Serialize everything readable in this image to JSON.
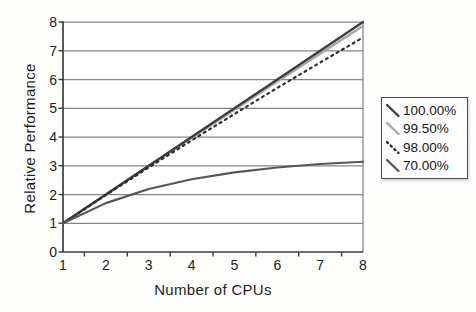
{
  "chart_data": {
    "type": "line",
    "title": "",
    "xlabel": "Number of CPUs",
    "ylabel": "Relative Performance",
    "x": [
      1,
      2,
      3,
      4,
      5,
      6,
      7,
      8
    ],
    "xlim": [
      1,
      8
    ],
    "ylim": [
      0,
      8
    ],
    "xticks": [
      1,
      2,
      3,
      4,
      5,
      6,
      7,
      8
    ],
    "yticks": [
      0,
      1,
      2,
      3,
      4,
      5,
      6,
      7,
      8
    ],
    "grid": "horizontal-only",
    "legend_position": "outside-right-middle",
    "series": [
      {
        "name": "100.00%",
        "line_style": "solid",
        "color": "#3d3d3d",
        "values": [
          1,
          2,
          3,
          4,
          5,
          6,
          7,
          8
        ]
      },
      {
        "name": "99.50%",
        "line_style": "solid",
        "color": "#a8a8a8",
        "values": [
          1,
          2.0,
          2.99,
          3.97,
          4.95,
          5.93,
          6.9,
          7.86
        ]
      },
      {
        "name": "98.00%",
        "line_style": "dotted",
        "color": "#2e2e2e",
        "values": [
          1,
          1.98,
          2.94,
          3.88,
          4.8,
          5.71,
          6.59,
          7.46
        ]
      },
      {
        "name": "70.00%",
        "line_style": "solid",
        "color": "#565656",
        "values": [
          1,
          1.7,
          2.19,
          2.53,
          2.77,
          2.94,
          3.06,
          3.14
        ]
      }
    ],
    "colors": {
      "gridline": "#858585",
      "axis": "#3c3c3c",
      "text": "#1f1f1f",
      "plot_background": "#ffffff",
      "legend_border": "#4b4b4b"
    }
  }
}
